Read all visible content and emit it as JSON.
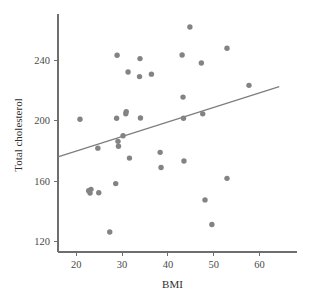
{
  "chart_data": {
    "type": "scatter",
    "title": "",
    "xlabel": "BMI",
    "ylabel": "Total cholesterol",
    "xlim": [
      16,
      66
    ],
    "ylim": [
      113,
      268
    ],
    "xticks": [
      20,
      30,
      40,
      50,
      60
    ],
    "yticks": [
      120,
      160,
      200,
      240
    ],
    "grid": false,
    "legend": "none",
    "marker_color": "#838383",
    "trendline_color": "#7d7d7d",
    "axis_color": "#6e6e6e",
    "points": [
      {
        "x": 20.8,
        "y": 200.9
      },
      {
        "x": 22.7,
        "y": 153.6
      },
      {
        "x": 23.0,
        "y": 152.0
      },
      {
        "x": 23.2,
        "y": 154.5
      },
      {
        "x": 24.7,
        "y": 181.8
      },
      {
        "x": 24.9,
        "y": 152.2
      },
      {
        "x": 27.3,
        "y": 126.2
      },
      {
        "x": 28.6,
        "y": 158.3
      },
      {
        "x": 28.8,
        "y": 201.6
      },
      {
        "x": 28.9,
        "y": 243.3
      },
      {
        "x": 29.1,
        "y": 186.3
      },
      {
        "x": 29.2,
        "y": 183.0
      },
      {
        "x": 30.2,
        "y": 190.0
      },
      {
        "x": 30.8,
        "y": 204.6
      },
      {
        "x": 30.9,
        "y": 206.0
      },
      {
        "x": 31.3,
        "y": 232.2
      },
      {
        "x": 31.6,
        "y": 175.2
      },
      {
        "x": 33.8,
        "y": 229.2
      },
      {
        "x": 33.9,
        "y": 241.1
      },
      {
        "x": 34.0,
        "y": 201.8
      },
      {
        "x": 36.4,
        "y": 230.8
      },
      {
        "x": 38.3,
        "y": 179.0
      },
      {
        "x": 38.5,
        "y": 169.0
      },
      {
        "x": 43.1,
        "y": 243.5
      },
      {
        "x": 43.3,
        "y": 215.6
      },
      {
        "x": 43.4,
        "y": 201.6
      },
      {
        "x": 43.5,
        "y": 173.3
      },
      {
        "x": 44.8,
        "y": 262.0
      },
      {
        "x": 47.3,
        "y": 238.2
      },
      {
        "x": 47.6,
        "y": 204.5
      },
      {
        "x": 48.1,
        "y": 147.5
      },
      {
        "x": 49.6,
        "y": 131.2
      },
      {
        "x": 52.9,
        "y": 248.0
      },
      {
        "x": 52.9,
        "y": 161.8
      },
      {
        "x": 57.7,
        "y": 223.4
      }
    ],
    "trendline": {
      "x_start": 16.0,
      "y_start": 176.0,
      "x_end": 64.3,
      "y_end": 222.5
    }
  }
}
